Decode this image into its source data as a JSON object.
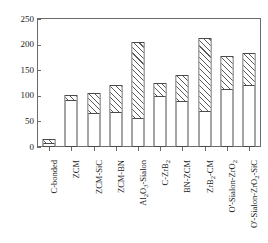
{
  "chart_data": {
    "type": "bar",
    "title": "",
    "subtitle": "",
    "xlabel": "",
    "ylabel": "抗折强度/MPa",
    "ylim": [
      0,
      250
    ],
    "yticks": [
      0,
      50,
      100,
      150,
      200,
      250
    ],
    "ytick_labels": [
      "0",
      "50",
      "100",
      "150",
      "200",
      "250"
    ],
    "grid": false,
    "legend": "none",
    "stacked": true,
    "bar_style": {
      "lower_segment": "solid-white-outline",
      "upper_segment": "diagonal-hatch"
    },
    "categories": [
      "C-bonded",
      "ZCM",
      "ZCM-SiC",
      "ZCM-BN",
      "Al2O3-Sialon",
      "C-ZrB2",
      "BN-ZCM",
      "ZrB2-CM",
      "O'-Sialon-ZrO2",
      "O'-Sialon-ZrO2-SiC"
    ],
    "series": [
      {
        "name": "lower",
        "values": [
          8,
          91,
          67,
          69,
          57,
          99,
          90,
          70,
          113,
          121
        ]
      },
      {
        "name": "upper",
        "values": [
          7,
          11,
          39,
          53,
          148,
          26,
          51,
          143,
          64,
          63
        ]
      }
    ],
    "totals": [
      15,
      102,
      106,
      122,
      205,
      125,
      141,
      213,
      177,
      184
    ]
  },
  "axis": {
    "y_title": "抗折强度/MPa",
    "y_ticks": [
      {
        "label": "250",
        "value": 250
      },
      {
        "label": "200",
        "value": 200
      },
      {
        "label": "150",
        "value": 150
      },
      {
        "label": "100",
        "value": 100
      },
      {
        "label": "50",
        "value": 50
      },
      {
        "label": "0",
        "value": 0
      }
    ]
  },
  "categories": [
    {
      "id": "c-bonded",
      "prefix": "C-bonded",
      "sub": "",
      "suffix": ""
    },
    {
      "id": "zcm",
      "prefix": "ZCM",
      "sub": "",
      "suffix": ""
    },
    {
      "id": "zcm-sic",
      "prefix": "ZCM-SiC",
      "sub": "",
      "suffix": ""
    },
    {
      "id": "zcm-bn",
      "prefix": "ZCM-BN",
      "sub": "",
      "suffix": ""
    },
    {
      "id": "al2o3-sialon",
      "prefix": "Al",
      "sub": "2",
      "suffix": "O3-Sialon"
    },
    {
      "id": "c-zrb2",
      "prefix": "C-ZrB",
      "sub": "2",
      "suffix": ""
    },
    {
      "id": "bn-zcm",
      "prefix": "BN-ZCM",
      "sub": "",
      "suffix": ""
    },
    {
      "id": "zrb2-cm",
      "prefix": "ZrB",
      "sub": "2",
      "suffix": "-CM"
    },
    {
      "id": "o-sialon-zro2",
      "prefix": "O'-Sialon-ZrO",
      "sub": "2",
      "suffix": ""
    },
    {
      "id": "o-sialon-zro2-sic",
      "prefix": "O'-Sialon-ZrO",
      "sub": "2",
      "suffix": "-SiC"
    }
  ],
  "colors": {
    "frame": "#6a6a6a",
    "bar_outline": "#4a4a4a",
    "hatch": "#5a5a5a",
    "background": "#ffffff",
    "text": "#1a1a1a"
  }
}
